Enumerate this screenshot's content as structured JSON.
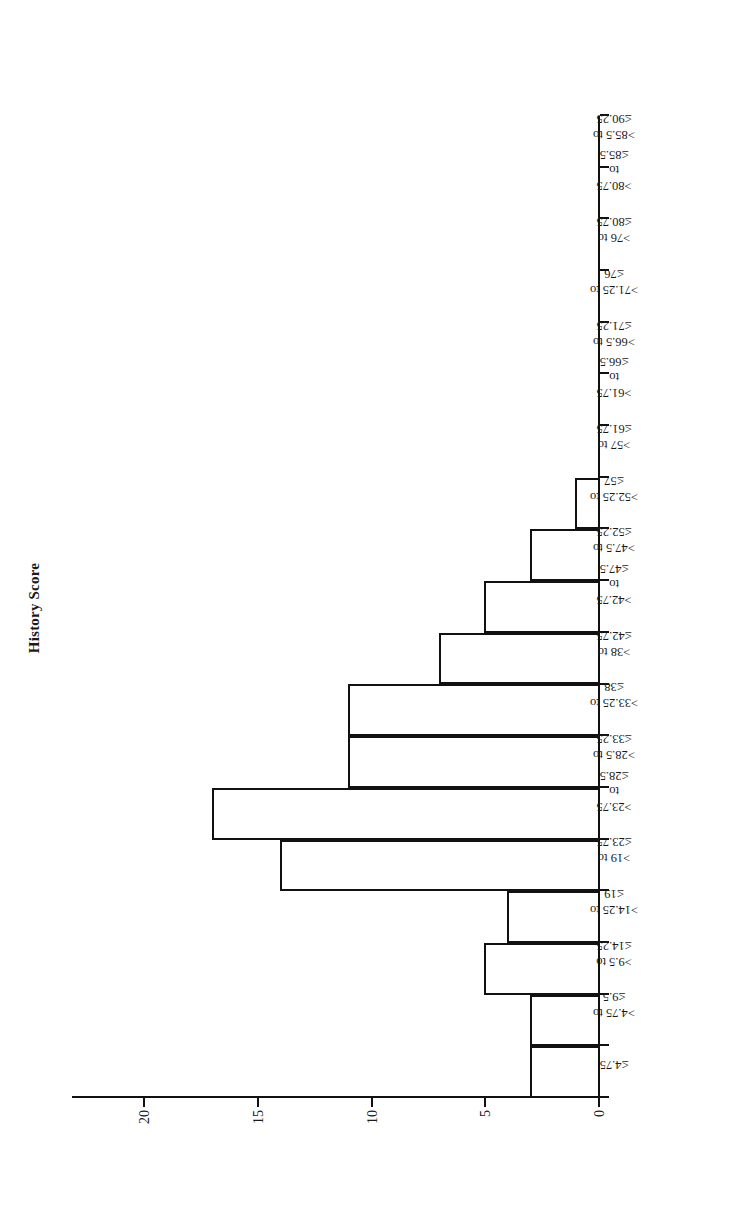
{
  "chart_data": {
    "type": "bar",
    "title": "History Score",
    "xlabel": "",
    "ylabel": "Number of Cases",
    "ylim": [
      0,
      22
    ],
    "yticks": [
      0,
      5,
      10,
      15,
      20
    ],
    "grid": false,
    "legend": null,
    "orientation": "rotated-90",
    "categories": [
      "≤4.75",
      ">4.75 to ≤9.5",
      ">9.5 to ≤14.25",
      ">14.25 to ≤19",
      ">19 to ≤23.75",
      ">23.75 to ≤28.5",
      ">28.5 to ≤33.25",
      ">33.25 to ≤38",
      ">38 to ≤42.75",
      ">42.75 to ≤47.5",
      ">47.5 to ≤52.25",
      ">52.25 to ≤57",
      ">57 to ≤61.75",
      ">61.75 to ≤66.5",
      ">66.5 to ≤71.25",
      ">71.25 to ≤76",
      ">76 to ≤80.75",
      ">80.75 to ≤85.5",
      ">85.5 to ≤90.25"
    ],
    "category_lines": [
      [
        "≤4.75"
      ],
      [
        ">4.75 to",
        "≤9.5"
      ],
      [
        ">9.5 to",
        "≤14.25"
      ],
      [
        ">14.25 to",
        "≤19"
      ],
      [
        ">19 to",
        "≤23.75"
      ],
      [
        ">23.75",
        "to",
        "≤28.5"
      ],
      [
        ">28.5 to",
        "≤33.25"
      ],
      [
        ">33.25 to",
        "≤38"
      ],
      [
        ">38 to",
        "≤42.75"
      ],
      [
        ">42.75",
        "to",
        "≤47.5"
      ],
      [
        ">47.5 to",
        "≤52.25"
      ],
      [
        ">52.25 to",
        "≤57"
      ],
      [
        ">57 to",
        "≤61.75"
      ],
      [
        ">61.75",
        "to",
        "≤66.5"
      ],
      [
        ">66.5 to",
        "≤71.25"
      ],
      [
        ">71.25 to",
        "≤76"
      ],
      [
        ">76 to",
        "≤80.75"
      ],
      [
        ">80.75",
        "to",
        "≤85.5"
      ],
      [
        ">85.5 to",
        "≤90.25"
      ]
    ],
    "values": [
      3,
      3,
      5,
      4,
      14,
      17,
      11,
      11,
      7,
      5,
      3,
      1,
      0,
      0,
      0,
      0,
      0,
      0,
      0
    ]
  },
  "style": {
    "bar_fill": "#ffffff",
    "bar_stroke": "#111111",
    "axis_color": "#111111",
    "background": "#ffffff"
  }
}
